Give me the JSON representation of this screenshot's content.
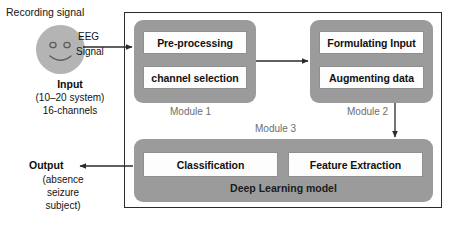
{
  "diagram": {
    "title_present": false,
    "left_panel": {
      "recording_signal_label": "Recording signal",
      "face_icon": "smiley-face-icon",
      "arrow_label_line1": "EEG",
      "arrow_label_line2": "Signal",
      "input_title": "Input",
      "input_sub1": "(10–20 system)",
      "input_sub2": "16-channels",
      "output_title": "Output",
      "output_sub1": "(absence",
      "output_sub2": "seizure",
      "output_sub3": "subject)"
    },
    "modules": [
      {
        "id": "module1",
        "caption": "Module 1",
        "blocks": [
          "Pre-processing",
          "channel selection"
        ]
      },
      {
        "id": "module2",
        "caption": "Module 2",
        "blocks": [
          "Formulating Input",
          "Augmenting data"
        ]
      },
      {
        "id": "module3",
        "caption": "Module 3",
        "blocks": [
          "Classification",
          "Feature Extraction"
        ],
        "footer_label": "Deep Learning model"
      }
    ],
    "arrows": [
      {
        "name": "input-to-module1",
        "direction": "right"
      },
      {
        "name": "module1-to-module2",
        "direction": "right"
      },
      {
        "name": "module2-to-module3",
        "direction": "down"
      },
      {
        "name": "module3-to-output",
        "direction": "left"
      }
    ],
    "colors": {
      "module_fill": "#9b9b9b",
      "inner_box_fill": "#fdfdfd",
      "frame_border": "#2b2b2b",
      "caption_text": "#6d6d6d",
      "face_fill": "#b4b4b4",
      "arrow_stroke": "#2b2b2b"
    }
  }
}
